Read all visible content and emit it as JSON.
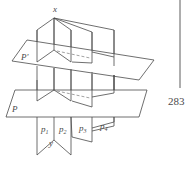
{
  "figure": {
    "labels": {
      "top_point": "x",
      "bottom_point": "y",
      "upper_plane": "P'",
      "lower_plane": "P",
      "pages": [
        "p",
        "p",
        "p",
        "p"
      ],
      "page_subscripts": [
        "1",
        "2",
        "3",
        "4"
      ]
    }
  },
  "page": {
    "number": "283"
  },
  "colors": {
    "line": "#4a4a4a",
    "dashed": "#8a8a8a",
    "background": "#ffffff"
  }
}
